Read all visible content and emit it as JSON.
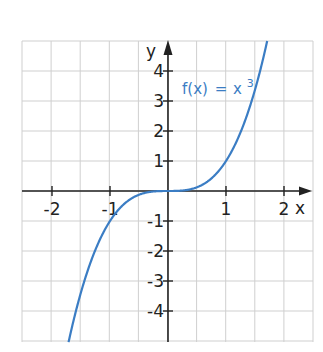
{
  "chart_data": {
    "type": "line",
    "title": "",
    "xlabel": "x",
    "ylabel": "y",
    "xlim": [
      -2.5,
      2.5
    ],
    "ylim": [
      -5,
      5
    ],
    "grid": true,
    "grid_step_x": 0.5,
    "grid_step_y": 1,
    "x_ticks": [
      -2,
      -1,
      1,
      2
    ],
    "x_tick_labels": [
      "-2",
      "-1",
      "1",
      "2"
    ],
    "y_ticks": [
      -4,
      -3,
      -2,
      -1,
      1,
      2,
      3,
      4
    ],
    "y_tick_labels": [
      "-4",
      "-3",
      "-2",
      "-1",
      "1",
      "2",
      "3",
      "4"
    ],
    "series": [
      {
        "name": "f(x) = x³",
        "label_text": "f(x)",
        "label_equals": "=",
        "label_base": "x",
        "label_exponent": "3",
        "expression": "x^3",
        "x": [
          -1.71,
          -1.5,
          -1.25,
          -1,
          -0.75,
          -0.5,
          -0.25,
          0,
          0.25,
          0.5,
          0.75,
          1,
          1.25,
          1.5,
          1.71
        ],
        "values": [
          -5.0,
          -3.375,
          -1.953,
          -1,
          -0.422,
          -0.125,
          -0.016,
          0,
          0.016,
          0.125,
          0.422,
          1,
          1.953,
          3.375,
          5.0
        ],
        "color": "#3b7dc4"
      }
    ],
    "legend": "inline annotation near upper right of curve"
  },
  "colors": {
    "curve": "#3b7dc4",
    "axis": "#222222",
    "grid": "#cfcfcf",
    "background": "#ffffff"
  }
}
